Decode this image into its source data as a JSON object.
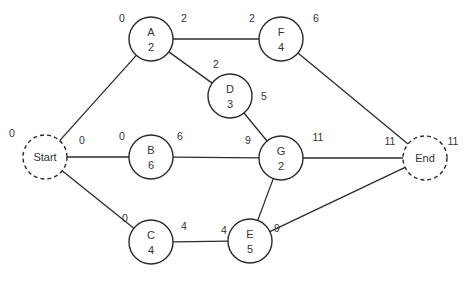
{
  "diagram": {
    "type": "activity-on-node network",
    "nodes": [
      {
        "id": "Start",
        "label": "Start",
        "duration": "",
        "x": 45,
        "y": 157,
        "dashed": true,
        "es": "0"
      },
      {
        "id": "A",
        "label": "A",
        "duration": "2",
        "x": 151,
        "y": 39,
        "es": "0",
        "ef": "2"
      },
      {
        "id": "B",
        "label": "B",
        "duration": "6",
        "x": 151,
        "y": 157,
        "es": "0",
        "ef": "6"
      },
      {
        "id": "C",
        "label": "C",
        "duration": "4",
        "x": 151,
        "y": 242,
        "es": "0",
        "ef": "4"
      },
      {
        "id": "D",
        "label": "D",
        "duration": "3",
        "x": 230,
        "y": 96,
        "es": "2",
        "ef": "5"
      },
      {
        "id": "F",
        "label": "F",
        "duration": "4",
        "x": 281,
        "y": 39,
        "es": "2",
        "ef": "6"
      },
      {
        "id": "G",
        "label": "G",
        "duration": "2",
        "x": 281,
        "y": 158,
        "es": "9",
        "ef": "11"
      },
      {
        "id": "E",
        "label": "E",
        "duration": "5",
        "x": 250,
        "y": 241,
        "es": "4",
        "ef": "9"
      },
      {
        "id": "End",
        "label": "End",
        "duration": "",
        "x": 425,
        "y": 158,
        "dashed": true,
        "es": "11",
        "ef": "11"
      }
    ],
    "edges": [
      [
        "Start",
        "A"
      ],
      [
        "Start",
        "B"
      ],
      [
        "Start",
        "C"
      ],
      [
        "A",
        "F"
      ],
      [
        "A",
        "D"
      ],
      [
        "D",
        "G"
      ],
      [
        "B",
        "G"
      ],
      [
        "C",
        "E"
      ],
      [
        "E",
        "G"
      ],
      [
        "F",
        "End"
      ],
      [
        "G",
        "End"
      ],
      [
        "E",
        "End"
      ]
    ],
    "time_labels": [
      {
        "text": "0",
        "x": 12,
        "y": 137
      },
      {
        "text": "0",
        "x": 82,
        "y": 144
      },
      {
        "text": "0",
        "x": 122,
        "y": 22
      },
      {
        "text": "2",
        "x": 184,
        "y": 22
      },
      {
        "text": "2",
        "x": 216,
        "y": 68
      },
      {
        "text": "5",
        "x": 264,
        "y": 100
      },
      {
        "text": "2",
        "x": 252,
        "y": 22
      },
      {
        "text": "6",
        "x": 316,
        "y": 22
      },
      {
        "text": "0",
        "x": 122,
        "y": 140
      },
      {
        "text": "6",
        "x": 180,
        "y": 140
      },
      {
        "text": "9",
        "x": 248,
        "y": 144
      },
      {
        "text": "11",
        "x": 318,
        "y": 141
      },
      {
        "text": "11",
        "x": 390,
        "y": 145
      },
      {
        "text": "11",
        "x": 453,
        "y": 145
      },
      {
        "text": "0",
        "x": 125,
        "y": 222
      },
      {
        "text": "4",
        "x": 184,
        "y": 230
      },
      {
        "text": "4",
        "x": 224,
        "y": 234
      },
      {
        "text": "9",
        "x": 277,
        "y": 232
      }
    ]
  }
}
